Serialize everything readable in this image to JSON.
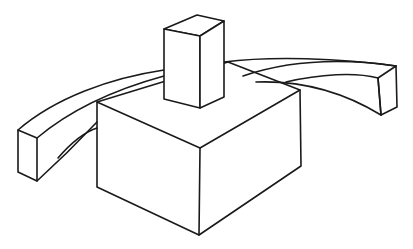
{
  "figure": {
    "background": "#ffffff",
    "stroke_color": "#1a1a1a",
    "stroke_width": 1.6
  },
  "shapes": {
    "large_box": "large-box",
    "small_box": "small-box",
    "curved_beam_left": "curved-beam-left",
    "curved_beam_right": "curved-beam-right"
  }
}
